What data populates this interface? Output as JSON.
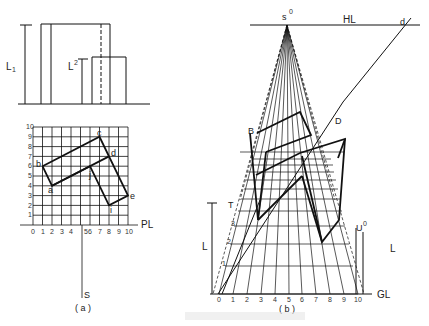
{
  "figure": {
    "panel_a_label": "( a )",
    "panel_b_label": "( b )",
    "elevation": {
      "L1": "L",
      "L1_sub": "1",
      "L2": "L",
      "L2_sub": "2"
    },
    "plan": {
      "x_ticks": [
        "0",
        "1",
        "2",
        "3",
        "4",
        "5",
        "6",
        "7",
        "8",
        "9",
        "10"
      ],
      "y_ticks": [
        "1",
        "2",
        "3",
        "4",
        "5",
        "6",
        "7",
        "8",
        "9",
        "10"
      ],
      "PL": "PL",
      "S": "S",
      "points": {
        "a": "a",
        "b": "b",
        "c": "c",
        "d": "d",
        "e": "e",
        "i": "i",
        "j": "j"
      }
    },
    "perspective": {
      "s0": "s",
      "s0_sup": "0",
      "HL": "HL",
      "GL": "GL",
      "d": "d",
      "D": "D",
      "B": "B",
      "T": "T",
      "U": "U",
      "U_sup": "0",
      "L1": "L",
      "L1_sub": "1",
      "L2": "L",
      "L2_sub": "2",
      "gl_ticks": [
        "0",
        "1",
        "2",
        "3",
        "4",
        "5",
        "6",
        "7",
        "8",
        "9",
        "10"
      ],
      "height_ticks": [
        "1",
        "2",
        "3",
        "4",
        "5",
        "6",
        "7",
        "8",
        "9",
        "10"
      ]
    }
  }
}
